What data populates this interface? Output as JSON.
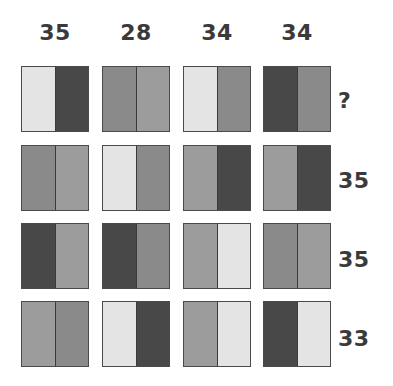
{
  "shades": {
    "light": "#e4e4e4",
    "medium_light": "#9c9c9c",
    "medium": "#8a8a8a",
    "dark": "#484848"
  },
  "column_labels": [
    "35",
    "28",
    "34",
    "34"
  ],
  "row_labels": [
    "?",
    "35",
    "35",
    "33"
  ],
  "grid": [
    [
      {
        "left": "light",
        "right": "dark"
      },
      {
        "left": "medium",
        "right": "medium_light"
      },
      {
        "left": "light",
        "right": "medium"
      },
      {
        "left": "dark",
        "right": "medium"
      }
    ],
    [
      {
        "left": "medium",
        "right": "medium_light"
      },
      {
        "left": "light",
        "right": "medium"
      },
      {
        "left": "medium_light",
        "right": "dark"
      },
      {
        "left": "medium_light",
        "right": "dark"
      }
    ],
    [
      {
        "left": "dark",
        "right": "medium_light"
      },
      {
        "left": "dark",
        "right": "medium"
      },
      {
        "left": "medium_light",
        "right": "light"
      },
      {
        "left": "medium",
        "right": "medium_light"
      }
    ],
    [
      {
        "left": "medium_light",
        "right": "medium"
      },
      {
        "left": "light",
        "right": "dark"
      },
      {
        "left": "medium_light",
        "right": "light"
      },
      {
        "left": "dark",
        "right": "light"
      }
    ]
  ]
}
